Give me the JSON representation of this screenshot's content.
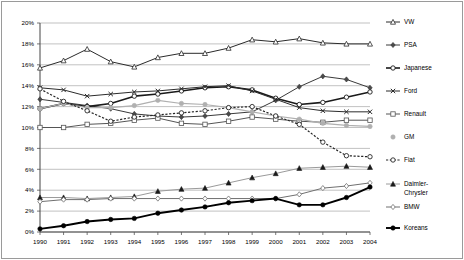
{
  "chart_data": {
    "type": "line",
    "title": "",
    "subtitle": "",
    "xlabel": "",
    "ylabel": "",
    "x": [
      1990,
      1991,
      1992,
      1993,
      1994,
      1995,
      1996,
      1997,
      1998,
      1999,
      2000,
      2001,
      2002,
      2003,
      2004
    ],
    "xtick_labels": [
      "1990",
      "1991",
      "1992",
      "1993",
      "1994",
      "1995",
      "1996",
      "1997",
      "1998",
      "1999",
      "2000",
      "2001",
      "2002",
      "2003",
      "2004"
    ],
    "ytick_labels": [
      "0%",
      "2%",
      "4%",
      "6%",
      "8%",
      "10%",
      "12%",
      "14%",
      "16%",
      "18%",
      "20%"
    ],
    "ytick_values": [
      0,
      2,
      4,
      6,
      8,
      10,
      12,
      14,
      16,
      18,
      20
    ],
    "ylim": [
      0,
      20
    ],
    "xlim": [
      1990,
      2004
    ],
    "grid": "horizontal",
    "legend_position": "right",
    "series": [
      {
        "name": "VW",
        "marker": "triangle-open",
        "color": "#2b2b2b",
        "dash": "solid",
        "width": 1.0,
        "values": [
          15.7,
          16.4,
          17.5,
          16.3,
          15.8,
          16.7,
          17.1,
          17.1,
          17.6,
          18.4,
          18.2,
          18.5,
          18.1,
          18.0,
          18.0
        ]
      },
      {
        "name": "PSA",
        "marker": "diamond-filled",
        "color": "#3a3a3a",
        "dash": "solid",
        "width": 1.0,
        "values": [
          12.7,
          12.4,
          12.1,
          11.8,
          11.3,
          11.1,
          11.0,
          11.1,
          11.3,
          11.5,
          12.6,
          13.9,
          14.9,
          14.6,
          13.8
        ]
      },
      {
        "name": "Japanese",
        "marker": "circle-open",
        "color": "#1a1a1a",
        "dash": "solid",
        "width": 1.6,
        "values": [
          11.8,
          12.3,
          12.0,
          12.3,
          13.0,
          13.2,
          13.5,
          13.8,
          13.9,
          13.6,
          12.8,
          12.2,
          12.4,
          12.9,
          13.4
        ]
      },
      {
        "name": "Ford",
        "marker": "cross-x",
        "color": "#2b2b2b",
        "dash": "solid",
        "width": 1.0,
        "values": [
          13.8,
          13.6,
          13.0,
          13.2,
          13.4,
          13.5,
          13.7,
          13.9,
          14.0,
          13.5,
          12.7,
          11.9,
          11.6,
          11.5,
          11.5
        ]
      },
      {
        "name": "Renault",
        "marker": "square-open",
        "color": "#555555",
        "dash": "solid",
        "width": 1.0,
        "values": [
          10.0,
          10.0,
          10.3,
          10.4,
          10.7,
          10.9,
          10.4,
          10.3,
          10.6,
          11.0,
          10.8,
          10.6,
          10.5,
          10.7,
          10.7
        ]
      },
      {
        "name": "GM",
        "marker": "circle-filled",
        "color": "#b0b0b0",
        "dash": "solid",
        "width": 1.2,
        "values": [
          11.8,
          12.3,
          11.9,
          11.9,
          12.1,
          12.6,
          12.3,
          12.2,
          11.9,
          11.5,
          11.1,
          10.8,
          10.4,
          10.2,
          10.1
        ]
      },
      {
        "name": "Fiat",
        "marker": "circle-open",
        "color": "#262626",
        "dash": "dotted",
        "width": 1.2,
        "values": [
          13.7,
          12.5,
          11.6,
          10.6,
          11.0,
          11.2,
          11.4,
          11.6,
          11.9,
          12.0,
          11.1,
          10.3,
          8.6,
          7.3,
          7.2
        ]
      },
      {
        "name": "Daimler-Chrysler",
        "marker": "triangle-filled",
        "color": "#9a9a9a",
        "dash": "solid",
        "width": 1.0,
        "values": [
          3.3,
          3.3,
          3.2,
          3.3,
          3.4,
          3.9,
          4.1,
          4.2,
          4.7,
          5.2,
          5.6,
          6.1,
          6.2,
          6.3,
          6.2
        ]
      },
      {
        "name": "BMW",
        "marker": "diamond-open",
        "color": "#707070",
        "dash": "solid",
        "width": 1.0,
        "values": [
          2.9,
          3.1,
          3.1,
          3.2,
          3.2,
          3.2,
          3.2,
          3.2,
          3.2,
          3.2,
          3.2,
          3.6,
          4.2,
          4.4,
          4.7
        ]
      },
      {
        "name": "Koreans",
        "marker": "circle-filled",
        "color": "#000000",
        "dash": "solid",
        "width": 1.9,
        "values": [
          0.3,
          0.6,
          1.0,
          1.2,
          1.3,
          1.8,
          2.1,
          2.4,
          2.8,
          3.0,
          3.2,
          2.6,
          2.6,
          3.3,
          4.3
        ]
      }
    ]
  },
  "legend": {
    "items": [
      {
        "label": "VW"
      },
      {
        "label": "PSA"
      },
      {
        "label": "Japanese"
      },
      {
        "label": "Ford"
      },
      {
        "label": "Renault"
      },
      {
        "label": "GM"
      },
      {
        "label": "Fiat"
      },
      {
        "label": "Daimler-",
        "label2": "Chrysler"
      },
      {
        "label": "BMW"
      },
      {
        "label": "Koreans"
      }
    ]
  },
  "frame": {
    "border_color": "#9a9a9a"
  }
}
